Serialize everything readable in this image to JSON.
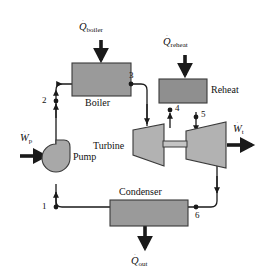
{
  "figure": {
    "background_color": "#ffffff",
    "line_color": "#1a1a1a",
    "arrow_color": "#1a1a1a"
  },
  "components": {
    "boiler": {
      "label": "Boiler",
      "fill": "#9a9a9a",
      "stroke": "#3a3a3a"
    },
    "reheat": {
      "label": "Reheat",
      "fill": "#8f8f8f",
      "stroke": "#3a3a3a"
    },
    "turbine": {
      "label": "Turbine",
      "fill": "#b2b2b2",
      "stroke": "#3a3a3a"
    },
    "condenser": {
      "label": "Condenser",
      "fill": "#9a9a9a",
      "stroke": "#3a3a3a"
    },
    "pump": {
      "label": "Pump",
      "fill": "#a8a8a8",
      "stroke": "#3a3a3a"
    }
  },
  "flows": {
    "q_boiler": {
      "symbol": "Q",
      "dot": "˙",
      "subscript": "boiler",
      "direction": "in"
    },
    "q_reheat": {
      "symbol": "Q",
      "dot": "˙",
      "subscript": "reheat",
      "direction": "in"
    },
    "q_out": {
      "symbol": "Q",
      "dot": "˙",
      "subscript": "out",
      "direction": "out"
    },
    "w_pump": {
      "symbol": "W",
      "dot": "˙",
      "subscript": "p",
      "direction": "in"
    },
    "w_turbine": {
      "symbol": "W",
      "dot": "˙",
      "subscript": "t",
      "direction": "out"
    }
  },
  "state_points": [
    {
      "id": "1",
      "label": "1"
    },
    {
      "id": "2",
      "label": "2"
    },
    {
      "id": "3",
      "label": "3"
    },
    {
      "id": "4",
      "label": "4"
    },
    {
      "id": "5",
      "label": "5"
    },
    {
      "id": "6",
      "label": "6"
    }
  ]
}
